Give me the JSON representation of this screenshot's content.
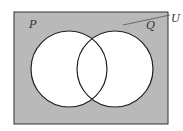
{
  "diagram": {
    "type": "venn",
    "universe_label": "U",
    "sets": [
      {
        "label": "P"
      },
      {
        "label": "Q"
      }
    ],
    "shaded_region": "complement of (P ∪ Q)",
    "colors": {
      "shade": "#b9b9b9",
      "circle_fill": "#ffffff",
      "stroke": "#222222"
    }
  }
}
